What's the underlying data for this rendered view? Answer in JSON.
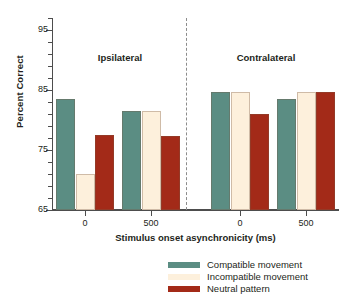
{
  "chart_data": {
    "type": "bar",
    "title": "",
    "xlabel": "Stimulus onset asynchronicity (ms)",
    "ylabel": "Percent Correct",
    "ylim": [
      65,
      97
    ],
    "ytick_labels": [
      "65",
      "75",
      "85",
      "95"
    ],
    "ytick_values": [
      65,
      75,
      85,
      95
    ],
    "yminor_step": 2,
    "grid": false,
    "legend_position": "bottom-right",
    "panels": [
      {
        "label": "Ipsilateral"
      },
      {
        "label": "Contralateral"
      }
    ],
    "categories": [
      "0",
      "500",
      "0",
      "500"
    ],
    "group_panels": [
      "Ipsilateral",
      "Ipsilateral",
      "Contralateral",
      "Contralateral"
    ],
    "series": [
      {
        "name": "Compatible movement",
        "color": "#5b8d83",
        "values": [
          83.5,
          81.5,
          84.7,
          83.5
        ]
      },
      {
        "name": "Incompatible movement",
        "color": "#fdf0dc",
        "values": [
          71.0,
          81.5,
          84.7,
          84.7
        ]
      },
      {
        "name": "Neutral pattern",
        "color": "#a32a18",
        "values": [
          77.5,
          77.3,
          81.0,
          84.7
        ]
      }
    ]
  },
  "axes": {
    "y_title": "Percent Correct",
    "x_title": "Stimulus onset asynchronicity (ms)",
    "y_labels": [
      "95",
      "85",
      "75",
      "65"
    ],
    "x_labels": [
      "0",
      "500",
      "0",
      "500"
    ]
  },
  "panels": {
    "left_label": "Ipsilateral",
    "right_label": "Contralateral"
  },
  "legend": {
    "items": [
      {
        "label": "Compatible movement",
        "color": "#5b8d83"
      },
      {
        "label": "Incompatible movement",
        "color": "#fdf0dc"
      },
      {
        "label": "Neutral pattern",
        "color": "#a32a18"
      }
    ]
  },
  "colors": {
    "compatible": "#5b8d83",
    "incompatible": "#fdf0dc",
    "neutral": "#a32a18",
    "axis": "#4d4d4d",
    "text": "#231f20",
    "divider": "#8c8c8c",
    "background": "#ffffff"
  }
}
